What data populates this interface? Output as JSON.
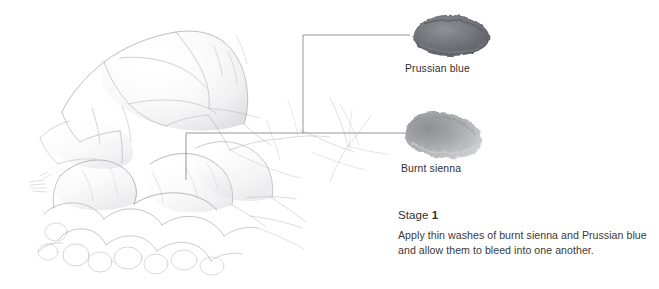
{
  "figure": {
    "type": "pencil-drawing-with-annotations",
    "background_color": "#ffffff",
    "pencil_color": "#8d8d93"
  },
  "swatches": [
    {
      "id": "prussian-blue",
      "label": "Prussian blue",
      "color": "#6f7276",
      "color_light": "#9a9da1",
      "color_dark": "#55585c",
      "x": 408,
      "y": 14,
      "width": 82,
      "height": 40
    },
    {
      "id": "burnt-sienna",
      "label": "Burnt sienna",
      "color": "#9b9ca0",
      "color_light": "#c9cacd",
      "color_dark": "#77797d",
      "x": 400,
      "y": 112,
      "width": 86,
      "height": 44
    }
  ],
  "leaders": [
    {
      "id": "leader-prussian-blue",
      "target": "prussian-blue",
      "color": "#8a8a8a",
      "points": "303,133 303,35 410,35"
    },
    {
      "id": "leader-burnt-sienna",
      "target": "burnt-sienna",
      "color": "#8a8a8a",
      "points": "186,180 186,133 408,133"
    }
  ],
  "caption": {
    "stage_prefix": "Stage",
    "stage_number": "1",
    "body": "Apply thin washes of burnt sienna and Prussian blue and allow them to bleed into one another."
  }
}
